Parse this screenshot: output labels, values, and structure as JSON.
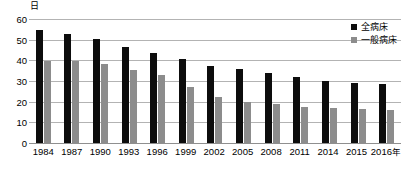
{
  "chart_data": {
    "type": "bar",
    "title": "",
    "xlabel": "",
    "ylabel": "日",
    "ylim": [
      0,
      60
    ],
    "yticks": [
      0,
      10,
      20,
      30,
      40,
      50,
      60
    ],
    "grid": true,
    "legend_position": "top-right",
    "x_suffix": "年",
    "categories": [
      "1984",
      "1987",
      "1990",
      "1993",
      "1996",
      "1999",
      "2002",
      "2005",
      "2008",
      "2011",
      "2014",
      "2015",
      "2016"
    ],
    "series": [
      {
        "name": "全病床",
        "color": "#0d0d0d",
        "values": [
          54.6,
          52.9,
          50.5,
          46.4,
          43.7,
          40.8,
          37.5,
          35.7,
          33.8,
          32.0,
          29.9,
          29.1,
          28.5
        ]
      },
      {
        "name": "一般病床",
        "color": "#8c8c8c",
        "values": [
          39.7,
          39.8,
          38.3,
          35.3,
          32.8,
          27.2,
          22.2,
          19.8,
          18.8,
          17.5,
          16.8,
          16.5,
          16.2
        ]
      }
    ]
  },
  "axis": {
    "y_unit_label": "日",
    "tick_labels": [
      "60",
      "50",
      "40",
      "30",
      "20",
      "10",
      "0"
    ],
    "x_axis_labels": [
      "1984",
      "1987",
      "1990",
      "1993",
      "1996",
      "1999",
      "2002",
      "2005",
      "2008",
      "2011",
      "2014",
      "2015",
      "2016"
    ],
    "x_axis_unit": "年"
  },
  "legend": {
    "items": [
      {
        "label": "全病床"
      },
      {
        "label": "一般病床"
      }
    ]
  },
  "colors": {
    "series_total": "#0d0d0d",
    "series_general": "#8c8c8c",
    "gridline": "#b3b3b3",
    "background": "#ffffff"
  }
}
